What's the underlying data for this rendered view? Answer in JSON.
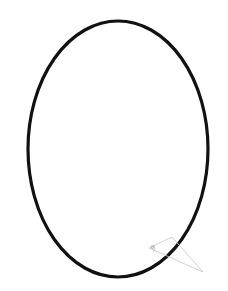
{
  "figure": {
    "background_color": "#ffffff",
    "width": 228,
    "height": 291,
    "ellipse": {
      "name": "ellipse-outline",
      "center_x": 118,
      "center_y": 149,
      "radius_x": 90,
      "radius_y": 128,
      "stroke_color": "#111111",
      "stroke_width": 3.2,
      "fill": "none"
    },
    "triangle": {
      "name": "angle-triangle",
      "stroke_color": "#cccccc",
      "stroke_width": 0.9,
      "fill": "none",
      "points": "149,248 172,237 203,272",
      "vertices": [
        {
          "label": "A",
          "x": 149,
          "y": 248
        },
        {
          "label": "B",
          "x": 172,
          "y": 237
        },
        {
          "label": "C",
          "x": 203,
          "y": 272
        }
      ]
    },
    "angle_marker": {
      "name": "angle-arc-marker",
      "path": "M 154 245 A 6 6 0 0 1 153 252",
      "stroke_color": "#bbbbbb",
      "stroke_width": 0.8,
      "label": "θ",
      "label_x": 151,
      "label_y": 249,
      "label_color": "#8a8a8a"
    }
  }
}
